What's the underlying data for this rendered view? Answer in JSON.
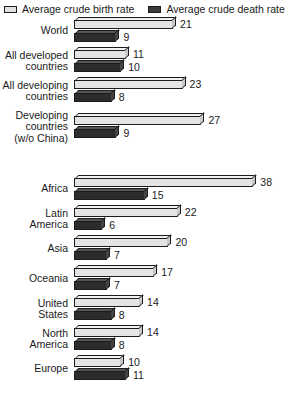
{
  "legend": {
    "items": [
      {
        "name": "birth-rate",
        "label": "Average crude birth rate",
        "swatch": "light",
        "color": "#e2e2e2"
      },
      {
        "name": "death-rate",
        "label": "Average crude death rate",
        "swatch": "dark",
        "color": "#3a3a3a"
      }
    ]
  },
  "chart_data": {
    "type": "bar",
    "orientation": "horizontal",
    "title": "",
    "xlabel": "",
    "ylabel": "",
    "xlim": [
      0,
      40
    ],
    "grid": false,
    "legend_position": "top",
    "categories": [
      "World",
      "All developed\ncountries",
      "All developing\ncountries",
      "Developing\ncountries\n(w/o China)",
      "Africa",
      "Latin\nAmerica",
      "Asia",
      "Oceania",
      "United\nStates",
      "North\nAmerica",
      "Europe"
    ],
    "series": [
      {
        "name": "Average crude birth rate",
        "values": [
          21,
          11,
          23,
          27,
          38,
          22,
          20,
          17,
          14,
          14,
          10
        ]
      },
      {
        "name": "Average crude death rate",
        "values": [
          9,
          10,
          8,
          9,
          15,
          6,
          7,
          7,
          8,
          8,
          11
        ]
      }
    ],
    "section_break_after_index": 3
  }
}
